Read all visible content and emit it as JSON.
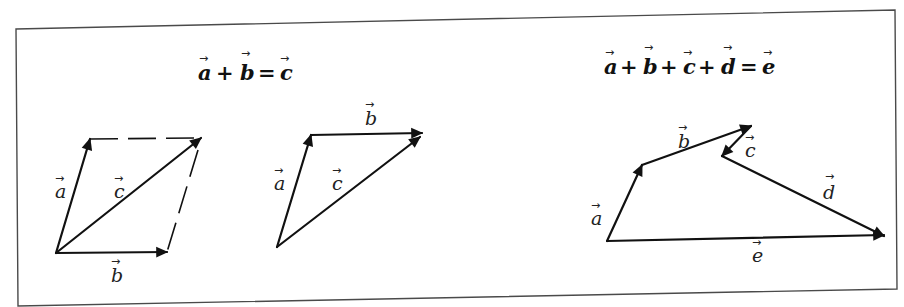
{
  "diagram": {
    "frame": {
      "stroke_color": "#4a4a4a"
    },
    "panels": [
      {
        "id": "parallelogram",
        "equation": {
          "terms": [
            "a",
            "b",
            "c"
          ],
          "operators": [
            "+",
            "="
          ],
          "text": "a + b = c"
        },
        "vectors": [
          {
            "name": "a",
            "label": "a",
            "from": [
              56,
              253
            ],
            "to": [
              90,
              139
            ]
          },
          {
            "name": "b",
            "label": "b",
            "from": [
              56,
              253
            ],
            "to": [
              167,
              252
            ]
          },
          {
            "name": "c",
            "label": "c",
            "from": [
              56,
              253
            ],
            "to": [
              201,
              138
            ]
          }
        ],
        "construction_lines": [
          {
            "style": "dashed",
            "from": [
              90,
              139
            ],
            "to": [
              198,
              138
            ]
          },
          {
            "style": "dashed",
            "from": [
              198,
              150
            ],
            "to": [
              167,
              252
            ]
          }
        ]
      },
      {
        "id": "triangle",
        "vectors": [
          {
            "name": "a",
            "label": "a",
            "from": [
              277,
              247
            ],
            "to": [
              311,
              135
            ]
          },
          {
            "name": "b",
            "label": "b",
            "from": [
              311,
              135
            ],
            "to": [
              422,
              133
            ]
          },
          {
            "name": "c",
            "label": "c",
            "from": [
              277,
              247
            ],
            "to": [
              420,
              137
            ]
          }
        ]
      },
      {
        "id": "polygon",
        "equation": {
          "terms": [
            "a",
            "b",
            "c",
            "d",
            "e"
          ],
          "operators": [
            "+",
            "+",
            "+",
            "="
          ],
          "text": "a + b + c + d = e"
        },
        "vectors": [
          {
            "name": "a",
            "label": "a",
            "from": [
              607,
              241
            ],
            "to": [
              642,
              165
            ]
          },
          {
            "name": "b",
            "label": "b",
            "from": [
              642,
              165
            ],
            "to": [
              751,
              126
            ]
          },
          {
            "name": "c",
            "label": "c",
            "from": [
              751,
              126
            ],
            "to": [
              722,
              156
            ]
          },
          {
            "name": "d",
            "label": "d",
            "from": [
              722,
              156
            ],
            "to": [
              884,
              236
            ]
          },
          {
            "name": "e",
            "label": "e",
            "from": [
              607,
              241
            ],
            "to": [
              884,
              235
            ]
          }
        ]
      }
    ],
    "labels": {
      "eq1": {
        "t1": "a",
        "op1": "+",
        "t2": "b",
        "op2": "=",
        "t3": "c"
      },
      "eq2": {
        "t1": "a",
        "op1": "+",
        "t2": "b",
        "op2": "+",
        "t3": "c",
        "op3": "+",
        "t4": "d",
        "op4": "=",
        "t5": "e"
      },
      "p1": {
        "a": "a",
        "b": "b",
        "c": "c"
      },
      "p2": {
        "a": "a",
        "b": "b",
        "c": "c"
      },
      "p3": {
        "a": "a",
        "b": "b",
        "c": "c",
        "d": "d",
        "e": "e"
      },
      "vector_arrow_glyph": "→"
    }
  }
}
